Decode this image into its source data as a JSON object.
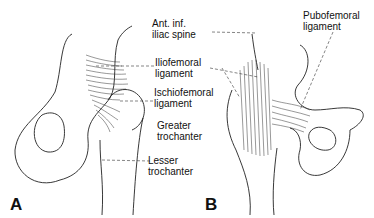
{
  "labels": {
    "ant_inf_iliac_spine": "Ant. inf.\niliac spine",
    "iliofemoral_ligament": "Iliofemoral\nligament",
    "ischiofemoral_ligament": "Ischiofemoral\nligament",
    "greater_trochanter": "Greater\ntrochanter",
    "lesser_trochanter": "Lesser\ntrochanter",
    "pubofemoral_ligament": "Pubofemoral\nligament"
  },
  "panels": {
    "a": "A",
    "b": "B"
  }
}
